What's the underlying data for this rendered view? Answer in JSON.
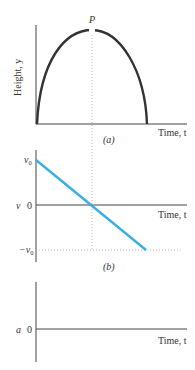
{
  "figure": {
    "panel_a": {
      "caption": "(a)",
      "y_axis_label": "Height, y",
      "x_axis_label": "Time, t",
      "peak_label": "P",
      "curve": "parabola",
      "curve_color": "#333333"
    },
    "panel_b": {
      "caption": "(b)",
      "y_axis_label": "v",
      "x_axis_label": "Time, t",
      "tick_top": "v0",
      "tick_zero": "0",
      "tick_bottom": "−v0",
      "line_color": "#3aaee0"
    },
    "panel_c": {
      "y_axis_label": "a",
      "x_axis_label": "Time, t",
      "tick_zero": "0"
    },
    "axis_color": "#444444",
    "guide_color": "#aaaaaa"
  }
}
